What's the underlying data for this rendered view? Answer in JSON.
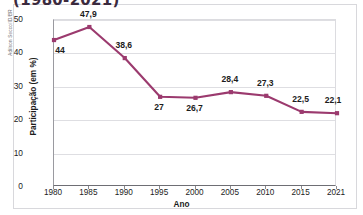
{
  "figure": {
    "title": "(1980-2021)",
    "credit": "Adilson Secco/ID/BR"
  },
  "chart_data": {
    "type": "line",
    "title": "(1980-2021)",
    "subtitle": "",
    "xlabel": "Ano",
    "ylabel": "Participação (em %)",
    "categories": [
      "1980",
      "1985",
      "1990",
      "1995",
      "2000",
      "2005",
      "2010",
      "2015",
      "2021"
    ],
    "values": [
      44,
      47.9,
      38.6,
      27,
      26.7,
      28.4,
      27.3,
      22.5,
      22.1
    ],
    "value_labels": [
      "44",
      "47,9",
      "38,6",
      "27",
      "26,7",
      "28,4",
      "27,3",
      "22,5",
      "22,1"
    ],
    "label_positions": [
      "below",
      "above",
      "above",
      "below",
      "below",
      "above",
      "above",
      "above",
      "above"
    ],
    "ylim": [
      0,
      50
    ],
    "yticks": [
      0,
      10,
      20,
      30,
      40,
      50
    ],
    "ytick_labels": [
      "0",
      "10",
      "20",
      "30",
      "40",
      "50"
    ],
    "grid": true,
    "legend": "none",
    "series_color": "#9B3A6E",
    "marker": "square",
    "gridline_color": "#dedee2"
  }
}
